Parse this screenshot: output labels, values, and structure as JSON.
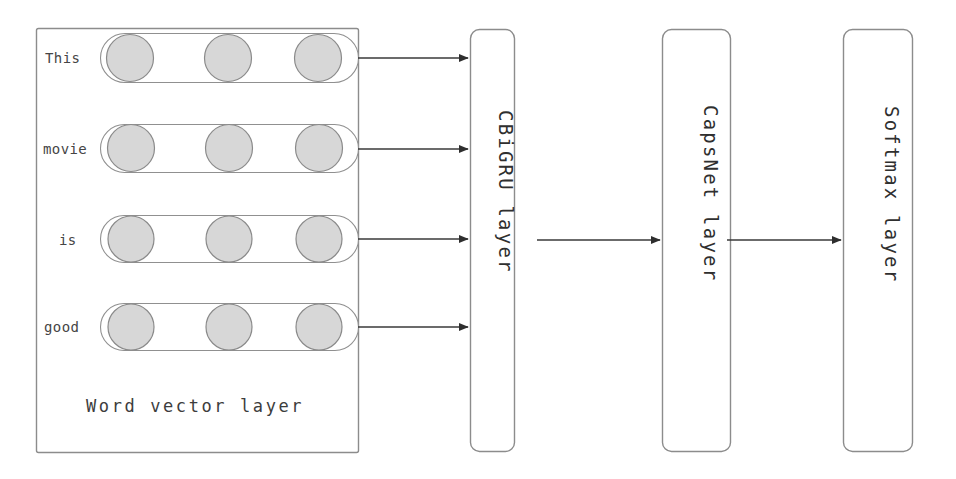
{
  "diagram": {
    "colors": {
      "circle_fill": "#d7d7d7",
      "circle_stroke": "#8a8a8a",
      "box_stroke": "#8c8c8c",
      "capsule_stroke": "#909090",
      "arrow": "#3a3a3a",
      "text": "#3d3d3d",
      "background": "#ffffff"
    },
    "word_vector_layer": {
      "caption": "Word vector layer",
      "rows": [
        {
          "word": "This",
          "units": 3
        },
        {
          "word": "movie",
          "units": 3
        },
        {
          "word": "is",
          "units": 3
        },
        {
          "word": "good",
          "units": 3
        }
      ]
    },
    "layers": [
      {
        "label": "CBiGRU layer"
      },
      {
        "label": "CapsNet layer"
      },
      {
        "label": "Softmax layer"
      }
    ],
    "connections": [
      {
        "from": "word-row-this",
        "to": "cbigru-layer"
      },
      {
        "from": "word-row-movie",
        "to": "cbigru-layer"
      },
      {
        "from": "word-row-is",
        "to": "cbigru-layer"
      },
      {
        "from": "word-row-good",
        "to": "cbigru-layer"
      },
      {
        "from": "cbigru-layer",
        "to": "capsnet-layer"
      },
      {
        "from": "capsnet-layer",
        "to": "softmax-layer"
      }
    ]
  }
}
